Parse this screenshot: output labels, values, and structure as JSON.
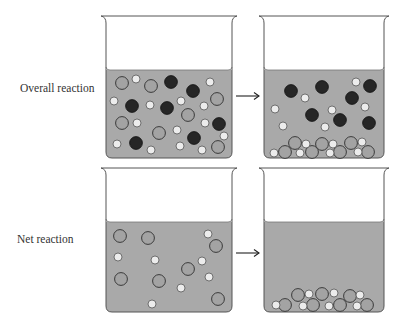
{
  "labels": {
    "overall": "Overall reaction",
    "net": "Net reaction"
  },
  "colors": {
    "liquid": "#a9a9a9",
    "outline": "#3a3a3a",
    "large_ion": "#a3a3a3",
    "small_ion": "#ececec",
    "spectator_dark": "#262626"
  },
  "beakers": [
    {
      "id": "overall-before",
      "x": 106,
      "top": 16,
      "liquid_top": 70,
      "bottom": 158,
      "width": 126,
      "particles": {
        "large": [
          [
            122,
            83
          ],
          [
            151,
            86
          ],
          [
            122,
            123
          ],
          [
            159,
            133
          ],
          [
            188,
            115
          ],
          [
            217,
            99
          ],
          [
            218,
            147
          ]
        ],
        "small": [
          [
            136,
            79
          ],
          [
            114,
            101
          ],
          [
            150,
            105
          ],
          [
            137,
            123
          ],
          [
            117,
            144
          ],
          [
            151,
            150
          ],
          [
            181,
            101
          ],
          [
            177,
            130
          ],
          [
            204,
            106
          ],
          [
            205,
            123
          ],
          [
            180,
            146
          ],
          [
            202,
            150
          ],
          [
            210,
            82
          ],
          [
            224,
            136
          ]
        ],
        "dark": [
          [
            171,
            82
          ],
          [
            193,
            91
          ],
          [
            132,
            106
          ],
          [
            167,
            108
          ],
          [
            219,
            124
          ],
          [
            136,
            143
          ],
          [
            194,
            138
          ]
        ]
      }
    },
    {
      "id": "overall-after",
      "x": 264,
      "top": 16,
      "liquid_top": 70,
      "bottom": 158,
      "width": 120,
      "particles": {
        "large": [
          [
            285,
            152
          ],
          [
            295,
            143
          ],
          [
            312,
            152
          ],
          [
            322,
            144
          ],
          [
            340,
            152
          ],
          [
            351,
            143
          ],
          [
            368,
            152
          ]
        ],
        "small": [
          [
            305,
            98
          ],
          [
            275,
            109
          ],
          [
            332,
            110
          ],
          [
            356,
            82
          ],
          [
            365,
            107
          ],
          [
            283,
            126
          ],
          [
            325,
            127
          ],
          [
            274,
            153
          ],
          [
            306,
            144
          ],
          [
            300,
            153
          ],
          [
            333,
            144
          ],
          [
            330,
            153
          ],
          [
            358,
            152
          ],
          [
            362,
            142
          ]
        ],
        "dark": [
          [
            291,
            91
          ],
          [
            322,
            87
          ],
          [
            352,
            98
          ],
          [
            370,
            86
          ],
          [
            312,
            115
          ],
          [
            340,
            120
          ],
          [
            369,
            123
          ]
        ]
      }
    },
    {
      "id": "net-before",
      "x": 106,
      "top": 168,
      "liquid_top": 222,
      "bottom": 312,
      "width": 126,
      "particles": {
        "large": [
          [
            120,
            236
          ],
          [
            148,
            238
          ],
          [
            216,
            246
          ],
          [
            121,
            279
          ],
          [
            159,
            281
          ],
          [
            188,
            269
          ],
          [
            218,
            299
          ]
        ],
        "small": [
          [
            208,
            234
          ],
          [
            118,
            257
          ],
          [
            155,
            260
          ],
          [
            202,
            261
          ],
          [
            209,
            277
          ],
          [
            181,
            288
          ],
          [
            152,
            304
          ]
        ],
        "dark": []
      }
    },
    {
      "id": "net-after",
      "x": 264,
      "top": 168,
      "liquid_top": 222,
      "bottom": 312,
      "width": 120,
      "particles": {
        "large": [
          [
            285,
            305
          ],
          [
            298,
            295
          ],
          [
            313,
            305
          ],
          [
            322,
            294
          ],
          [
            340,
            305
          ],
          [
            350,
            296
          ],
          [
            367,
            305
          ]
        ],
        "small": [
          [
            276,
            305
          ],
          [
            309,
            294
          ],
          [
            303,
            306
          ],
          [
            334,
            293
          ],
          [
            329,
            306
          ],
          [
            360,
            295
          ],
          [
            357,
            306
          ]
        ],
        "dark": []
      }
    }
  ],
  "arrows": [
    {
      "id": "arrow-overall",
      "x1": 236,
      "x2": 259,
      "y": 96
    },
    {
      "id": "arrow-net",
      "x1": 236,
      "x2": 259,
      "y": 253
    }
  ]
}
